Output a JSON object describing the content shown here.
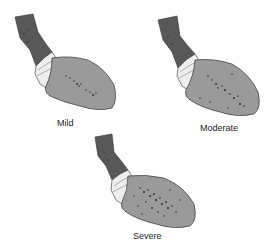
{
  "diagram": {
    "panels": [
      {
        "id": "mild",
        "label": "Mild"
      },
      {
        "id": "moderate",
        "label": "Moderate"
      },
      {
        "id": "severe",
        "label": "Severe"
      }
    ],
    "colors": {
      "esophagus": "#555555",
      "stomach": "#9a9a9a",
      "junction": "#eeeeee",
      "outline": "#333333",
      "lesion": "#2a2a2a"
    }
  }
}
